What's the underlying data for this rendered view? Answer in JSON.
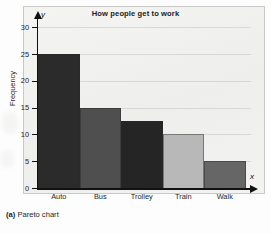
{
  "figure": {
    "caption_label": "(a)",
    "caption_text": " Pareto chart"
  },
  "chart_data": {
    "type": "bar",
    "title": "How people get to work",
    "xlabel": "x",
    "ylabel": "Frequency",
    "x_axis_name": "x",
    "y_axis_name": "y",
    "categories": [
      "Auto",
      "Bus",
      "Trolley",
      "Train",
      "Walk"
    ],
    "values": [
      25,
      15,
      12.5,
      10,
      5
    ],
    "ylim": [
      0,
      30
    ],
    "yticks": [
      0,
      5,
      10,
      15,
      20,
      25,
      30
    ],
    "ytick_labels": [
      "0",
      "5",
      "10",
      "15",
      "20",
      "25",
      "30"
    ],
    "grid": false,
    "legend": "none",
    "bar_colors": [
      "#2b2b2b",
      "#4f4f4f",
      "#252525",
      "#b8b8b8",
      "#666666"
    ],
    "plot_background": "#f2f2f0",
    "axis_color": "#111111",
    "sorted": "descending"
  }
}
